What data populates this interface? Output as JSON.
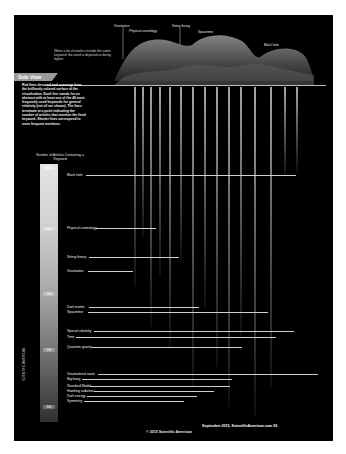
{
  "figure": {
    "intro_text": "When a lot of articles include the same keyword, the word is depicted as being higher.",
    "surface_labels": [
      "Gravitation",
      "Physical cosmology",
      "String theory",
      "Spacetime",
      "Black hole"
    ],
    "side_view": {
      "tab_label": "Side View",
      "description": "Red lines descend and converge from the brilliantly colored surface of the visualization. Each line stands for an abstract with at least one of the 40 most frequently used keywords for general relativity (not all are shown). The lines terminate at a point indicating the number of articles that mention the fixed keyword. Shorter lines correspond to more frequent mentions."
    },
    "scale": {
      "title": "Number of Articles Containing a Keyword",
      "ticks": [
        "500",
        "400",
        "300",
        "200",
        "100"
      ]
    },
    "keywords": [
      {
        "label": "Black hole"
      },
      {
        "label": "Physical cosmology"
      },
      {
        "label": "String theory"
      },
      {
        "label": "Gravitation"
      },
      {
        "label": "Dark matter"
      },
      {
        "label": "Spacetime"
      },
      {
        "label": "Special relativity"
      },
      {
        "label": "Time"
      },
      {
        "label": "Quantum gravity"
      },
      {
        "label": "Gravitational wave"
      },
      {
        "label": "Big bang"
      },
      {
        "label": "Standard Model"
      },
      {
        "label": "Hawking radiation"
      },
      {
        "label": "Dark energy"
      },
      {
        "label": "Symmetry"
      }
    ],
    "rotated_caption": "SCIENTIFIC AMERICAN"
  },
  "footer": {
    "page_info": "September 2015, ScientificAmerican.com  59",
    "copyright": "© 2015 Scientific American"
  }
}
